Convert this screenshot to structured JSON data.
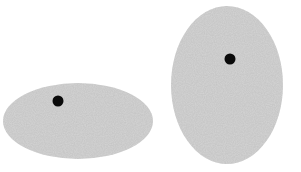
{
  "canvas": {
    "width": 301,
    "height": 172,
    "background": "#ffffff"
  },
  "colors": {
    "ellipse_fill": "#d4d4d4",
    "dot_fill": "#0a0a0a"
  },
  "shapes": [
    {
      "name": "horizontal-ellipse",
      "ellipse": {
        "cx": 78,
        "cy": 121,
        "rx": 75,
        "ry": 38
      },
      "dot": {
        "cx": 58,
        "cy": 101,
        "r": 5.5
      }
    },
    {
      "name": "vertical-ellipse",
      "ellipse": {
        "cx": 227,
        "cy": 85,
        "rx": 56,
        "ry": 79
      },
      "dot": {
        "cx": 230,
        "cy": 59,
        "r": 5.5
      }
    }
  ]
}
